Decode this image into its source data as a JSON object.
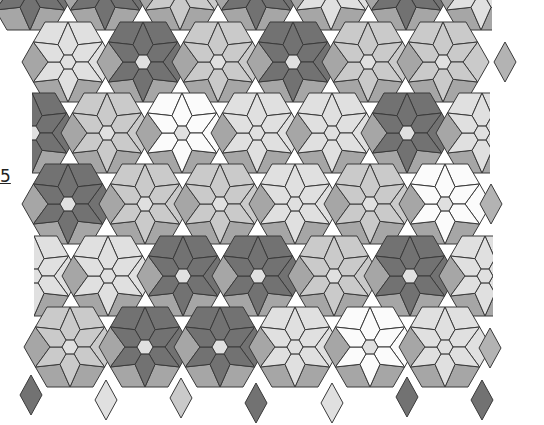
{
  "figure": {
    "kind": "star-of-david hexagon tessellation (grayscale quilt pattern)",
    "side_label": "5",
    "palette": {
      "white": "#fbfbfb",
      "light": "#e0e0e0",
      "lightmed": "#cacaca",
      "medium": "#b3b3b3",
      "dark": "#727272",
      "shade": "#a6a6a6",
      "outline": "#3a3a3a"
    },
    "block_geometry": {
      "hex_side": 8,
      "star_radius": 40,
      "inner_radius": 20,
      "outer_half_width": 46
    },
    "rows": [
      {
        "cy": -10,
        "blocks": [
          {
            "cx": 30,
            "star": "dark",
            "hex": "light",
            "part": "bottom"
          },
          {
            "cx": 105,
            "star": "dark",
            "hex": "light",
            "part": "bottom"
          },
          {
            "cx": 180,
            "star": "lightmed",
            "hex": "light",
            "part": "bottom"
          },
          {
            "cx": 256,
            "star": "dark",
            "hex": "light",
            "part": "bottom"
          },
          {
            "cx": 331,
            "star": "light",
            "hex": "light",
            "part": "bottom"
          },
          {
            "cx": 406,
            "star": "dark",
            "hex": "light",
            "part": "bottom"
          },
          {
            "cx": 481,
            "star": "light",
            "hex": "light",
            "part": "bottom-noright"
          }
        ]
      },
      {
        "cy": 62,
        "blocks": [
          {
            "cx": 68,
            "star": "light",
            "hex": "light",
            "part": "full"
          },
          {
            "cx": 143,
            "star": "dark",
            "hex": "light",
            "part": "full"
          },
          {
            "cx": 218,
            "star": "lightmed",
            "hex": "light",
            "part": "full"
          },
          {
            "cx": 293,
            "star": "dark",
            "hex": "light",
            "part": "full"
          },
          {
            "cx": 368,
            "star": "lightmed",
            "hex": "light",
            "part": "full"
          },
          {
            "cx": 443,
            "star": "lightmed",
            "hex": "light",
            "part": "full"
          }
        ],
        "extra_diamonds": [
          {
            "x": 505,
            "y": 62,
            "color": "medium"
          }
        ]
      },
      {
        "cy": 133,
        "blocks": [
          {
            "cx": 32,
            "star": "dark",
            "hex": "light",
            "part": "right-half"
          },
          {
            "cx": 107,
            "star": "lightmed",
            "hex": "light",
            "part": "full"
          },
          {
            "cx": 182,
            "star": "white",
            "hex": "light",
            "part": "full"
          },
          {
            "cx": 257,
            "star": "light",
            "hex": "light",
            "part": "full"
          },
          {
            "cx": 332,
            "star": "light",
            "hex": "light",
            "part": "full"
          },
          {
            "cx": 407,
            "star": "dark",
            "hex": "light",
            "part": "full"
          },
          {
            "cx": 482,
            "star": "light",
            "hex": "light",
            "part": "left-half"
          }
        ]
      },
      {
        "cy": 204,
        "blocks": [
          {
            "cx": 68,
            "star": "dark",
            "hex": "light",
            "part": "full"
          },
          {
            "cx": 145,
            "star": "lightmed",
            "hex": "light",
            "part": "full"
          },
          {
            "cx": 220,
            "star": "lightmed",
            "hex": "light",
            "part": "full"
          },
          {
            "cx": 295,
            "star": "light",
            "hex": "light",
            "part": "full"
          },
          {
            "cx": 370,
            "star": "lightmed",
            "hex": "light",
            "part": "full"
          },
          {
            "cx": 445,
            "star": "white",
            "hex": "light",
            "part": "full"
          }
        ],
        "extra_diamonds": [
          {
            "x": 491,
            "y": 204,
            "color": "medium"
          }
        ]
      },
      {
        "cy": 276,
        "blocks": [
          {
            "cx": 34,
            "star": "light",
            "hex": "light",
            "part": "right-half"
          },
          {
            "cx": 108,
            "star": "light",
            "hex": "light",
            "part": "full"
          },
          {
            "cx": 183,
            "star": "dark",
            "hex": "light",
            "part": "full"
          },
          {
            "cx": 258,
            "star": "dark",
            "hex": "light",
            "part": "full"
          },
          {
            "cx": 334,
            "star": "lightmed",
            "hex": "light",
            "part": "full"
          },
          {
            "cx": 410,
            "star": "dark",
            "hex": "light",
            "part": "full"
          },
          {
            "cx": 485,
            "star": "light",
            "hex": "light",
            "part": "left-half"
          }
        ]
      },
      {
        "cy": 347,
        "blocks": [
          {
            "cx": 70,
            "star": "lightmed",
            "hex": "light",
            "part": "full"
          },
          {
            "cx": 145,
            "star": "dark",
            "hex": "light",
            "part": "full"
          },
          {
            "cx": 220,
            "star": "dark",
            "hex": "light",
            "part": "full"
          },
          {
            "cx": 295,
            "star": "light",
            "hex": "light",
            "part": "full"
          },
          {
            "cx": 370,
            "star": "white",
            "hex": "light",
            "part": "full"
          },
          {
            "cx": 445,
            "star": "light",
            "hex": "light",
            "part": "full"
          }
        ],
        "extra_diamonds": [
          {
            "x": 490,
            "y": 348,
            "color": "medium"
          }
        ]
      }
    ],
    "bottom_diamonds": [
      {
        "x": 31,
        "y": 395,
        "color": "dark"
      },
      {
        "x": 106,
        "y": 400,
        "color": "light"
      },
      {
        "x": 181,
        "y": 398,
        "color": "lightmed"
      },
      {
        "x": 256,
        "y": 403,
        "color": "dark"
      },
      {
        "x": 332,
        "y": 403,
        "color": "light"
      },
      {
        "x": 407,
        "y": 397,
        "color": "dark"
      },
      {
        "x": 482,
        "y": 400,
        "color": "dark"
      }
    ]
  }
}
